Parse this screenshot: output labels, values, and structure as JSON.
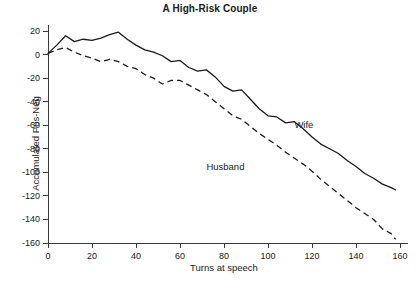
{
  "chart_data": {
    "type": "line",
    "title": "A High-Risk Couple",
    "xlabel": "Turns at speech",
    "ylabel": "Accumulated Pos-Neg",
    "xlim": [
      0,
      160
    ],
    "ylim": [
      -160,
      20
    ],
    "xticks": [
      0,
      20,
      40,
      60,
      80,
      100,
      120,
      140,
      160
    ],
    "xtick_labels": [
      "0",
      "20",
      "40",
      "60",
      "80",
      "100",
      "120",
      "140",
      "160"
    ],
    "yticks": [
      20,
      0,
      -20,
      -40,
      -60,
      -80,
      -100,
      -120,
      -140,
      -160
    ],
    "ytick_labels": [
      "20",
      "0",
      "-20",
      "-40",
      "-60",
      "-80",
      "-100",
      "-120",
      "-140",
      "-160"
    ],
    "grid": false,
    "legend_position": "inline-annotations",
    "annotations": [
      {
        "text": "Wife",
        "x": 112,
        "y": -55
      },
      {
        "text": "Husband",
        "x": 72,
        "y": -90
      }
    ],
    "series": [
      {
        "name": "Wife",
        "style": "solid",
        "color": "#1a1a1a",
        "x": [
          0,
          4,
          8,
          12,
          16,
          20,
          24,
          28,
          32,
          36,
          40,
          44,
          48,
          52,
          56,
          60,
          64,
          68,
          72,
          76,
          80,
          84,
          88,
          92,
          96,
          100,
          104,
          108,
          112,
          116,
          120,
          124,
          128,
          132,
          136,
          140,
          144,
          148,
          152,
          156,
          158
        ],
        "y": [
          1,
          8,
          16,
          11,
          13,
          12,
          14,
          17,
          19,
          13,
          8,
          4,
          2,
          -1,
          -6,
          -5,
          -11,
          -14,
          -13,
          -19,
          -27,
          -31,
          -30,
          -38,
          -46,
          -52,
          -53,
          -58,
          -57,
          -63,
          -70,
          -76,
          -80,
          -84,
          -90,
          -95,
          -101,
          -105,
          -110,
          -113,
          -115
        ]
      },
      {
        "name": "Husband",
        "style": "dashed",
        "color": "#1a1a1a",
        "x": [
          0,
          4,
          8,
          12,
          16,
          20,
          24,
          28,
          32,
          36,
          40,
          44,
          48,
          52,
          56,
          60,
          64,
          68,
          72,
          76,
          80,
          84,
          88,
          92,
          96,
          100,
          104,
          108,
          112,
          116,
          120,
          124,
          128,
          132,
          136,
          140,
          144,
          148,
          152,
          156,
          158
        ],
        "y": [
          1,
          4,
          6,
          2,
          -1,
          -3,
          -6,
          -4,
          -6,
          -10,
          -12,
          -17,
          -20,
          -25,
          -22,
          -22,
          -26,
          -30,
          -34,
          -40,
          -46,
          -52,
          -55,
          -61,
          -67,
          -72,
          -77,
          -83,
          -88,
          -93,
          -99,
          -106,
          -112,
          -118,
          -124,
          -130,
          -135,
          -140,
          -148,
          -152,
          -157
        ]
      }
    ]
  }
}
